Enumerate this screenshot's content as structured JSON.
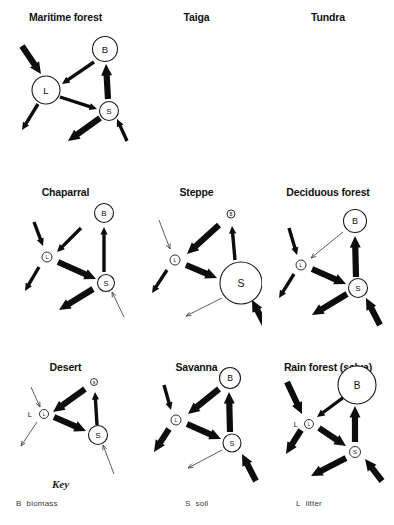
{
  "figure": {
    "width": 394,
    "height": 525,
    "background": "#ffffff",
    "ink_color": "#0d0d0d",
    "thin_arrow_color": "#4a4a4a"
  },
  "key": {
    "heading": "Key",
    "entries": [
      {
        "symbol": "B",
        "label": "biomass"
      },
      {
        "symbol": "S",
        "label": "soil"
      },
      {
        "symbol": "L",
        "label": "litter"
      }
    ]
  },
  "chart_data": {
    "type": "diagram",
    "compartment_legend": {
      "B": "biomass",
      "S": "soil",
      "L": "litter"
    },
    "flow_names": {
      "precip_to_litter": "precipitation input to litter",
      "biomass_to_litter": "litterfall (biomass to litter)",
      "litter_to_soil": "humus/decomposition (litter to soil)",
      "soil_to_biomass": "uptake (soil to biomass)",
      "litter_to_loss": "runoff loss from litter",
      "soil_to_loss": "leaching loss from soil",
      "weathering_to_soil": "weathering input to soil"
    },
    "panels": [
      {
        "id": "maritime-forest",
        "title": "Maritime forest",
        "nodes": [
          {
            "id": "B",
            "label": "B",
            "size": "medium",
            "cx": 105,
            "cy": 49,
            "r": 12.5,
            "font": 9.5
          },
          {
            "id": "L",
            "label": "L",
            "size": "medium",
            "cx": 46,
            "cy": 90,
            "r": 14,
            "font": 9.5
          },
          {
            "id": "S",
            "label": "S",
            "size": "small-medium",
            "cx": 109,
            "cy": 111,
            "r": 9.5,
            "font": 8
          }
        ],
        "flows": [
          {
            "name": "precip_to_litter",
            "weight": "thick",
            "x1": 22,
            "y1": 46,
            "x2": 41,
            "y2": 74
          },
          {
            "name": "biomass_to_litter",
            "weight": "medium",
            "x1": 94,
            "y1": 62,
            "x2": 62,
            "y2": 84
          },
          {
            "name": "soil_to_biomass",
            "weight": "thick",
            "x1": 108,
            "y1": 99,
            "x2": 106,
            "y2": 64
          },
          {
            "name": "litter_to_soil",
            "weight": "medium",
            "x1": 60,
            "y1": 97,
            "x2": 97,
            "y2": 109
          },
          {
            "name": "litter_to_loss",
            "weight": "medium",
            "x1": 38,
            "y1": 104,
            "x2": 22,
            "y2": 130
          },
          {
            "name": "soil_to_loss",
            "weight": "thick",
            "x1": 100,
            "y1": 118,
            "x2": 68,
            "y2": 141
          },
          {
            "name": "weathering_to_soil",
            "weight": "medium",
            "x1": 127,
            "y1": 141,
            "x2": 117,
            "y2": 119
          }
        ]
      },
      {
        "id": "taiga",
        "title": "Taiga",
        "nodes": [
          {
            "id": "B",
            "label": "B",
            "size": "medium",
            "cx": 95,
            "cy": 48,
            "r": 11.5,
            "font": 9
          },
          {
            "id": "L",
            "label": "L",
            "size": "medium",
            "cx": 42,
            "cy": 98,
            "r": 13,
            "font": 9.5
          },
          {
            "id": "S",
            "label": "S",
            "size": "tiny",
            "cx": 100,
            "cy": 122,
            "r": 4,
            "font": 4.5
          }
        ],
        "flows": [
          {
            "name": "precip_to_litter",
            "weight": "thin",
            "x1": 20,
            "y1": 52,
            "x2": 37,
            "y2": 80
          },
          {
            "name": "biomass_to_litter",
            "weight": "thick",
            "x1": 87,
            "y1": 59,
            "x2": 55,
            "y2": 88
          },
          {
            "name": "soil_to_biomass",
            "weight": "medium",
            "x1": 99,
            "y1": 113,
            "x2": 96,
            "y2": 62
          },
          {
            "name": "litter_to_soil",
            "weight": "thin",
            "x1": 57,
            "y1": 105,
            "x2": 92,
            "y2": 119
          },
          {
            "name": "litter_to_loss",
            "weight": "thick",
            "x1": 31,
            "y1": 110,
            "x2": 14,
            "y2": 136
          },
          {
            "name": "soil_to_loss",
            "weight": "thin",
            "x1": 89,
            "y1": 130,
            "x2": 56,
            "y2": 146
          },
          {
            "name": "weathering_to_soil",
            "weight": "thin",
            "x1": 117,
            "y1": 152,
            "x2": 105,
            "y2": 129
          }
        ]
      },
      {
        "id": "tundra",
        "title": "Tundra",
        "nodes": [
          {
            "id": "B",
            "label": "B",
            "size": "tiny",
            "cx": 95,
            "cy": 50,
            "r": 3.5,
            "font": 4,
            "outside_label": "B",
            "outside_dx": 5.5,
            "outside_dy": 0,
            "outside_font": 6.5
          },
          {
            "id": "L",
            "label": "L",
            "size": "tiny",
            "cx": 32,
            "cy": 102,
            "r": 4.5,
            "font": 4.5
          },
          {
            "id": "S",
            "label": "S",
            "size": "tiny",
            "cx": 92,
            "cy": 125,
            "r": 4.5,
            "font": 4.5
          }
        ],
        "flows": [
          {
            "name": "precip_to_litter",
            "weight": "thin",
            "x1": 17,
            "y1": 58,
            "x2": 29,
            "y2": 92
          },
          {
            "name": "biomass_to_litter",
            "weight": "thick",
            "x1": 81,
            "y1": 69,
            "x2": 42,
            "y2": 96
          },
          {
            "name": "soil_to_biomass",
            "weight": "thin",
            "x1": 92,
            "y1": 117,
            "x2": 93,
            "y2": 61
          },
          {
            "name": "litter_to_soil",
            "weight": "thin",
            "x1": 42,
            "y1": 107,
            "x2": 84,
            "y2": 121
          },
          {
            "name": "litter_to_loss",
            "weight": "thin",
            "x1": 26,
            "y1": 110,
            "x2": 9,
            "y2": 137
          },
          {
            "name": "weathering_to_soil",
            "weight": "thin",
            "x1": 109,
            "y1": 155,
            "x2": 97,
            "y2": 133
          }
        ]
      },
      {
        "id": "chaparral",
        "title": "Chaparral",
        "nodes": [
          {
            "id": "B",
            "label": "B",
            "size": "medium",
            "cx": 104,
            "cy": 213,
            "r": 9.5,
            "font": 8
          },
          {
            "id": "L",
            "label": "L",
            "size": "tiny",
            "cx": 47,
            "cy": 257,
            "r": 5,
            "font": 5
          },
          {
            "id": "S",
            "label": "S",
            "size": "small-medium",
            "cx": 106,
            "cy": 283,
            "r": 8.5,
            "font": 7.5
          }
        ],
        "flows": [
          {
            "name": "precip_to_litter",
            "weight": "medium",
            "x1": 34,
            "y1": 222,
            "x2": 43,
            "y2": 246
          },
          {
            "name": "biomass_to_litter",
            "weight": "medium",
            "x1": 81,
            "y1": 228,
            "x2": 57,
            "y2": 252
          },
          {
            "name": "soil_to_biomass",
            "weight": "medium",
            "x1": 104,
            "y1": 272,
            "x2": 104,
            "y2": 227
          },
          {
            "name": "litter_to_soil",
            "weight": "thick",
            "x1": 58,
            "y1": 262,
            "x2": 96,
            "y2": 279
          },
          {
            "name": "litter_to_loss",
            "weight": "medium",
            "x1": 39,
            "y1": 267,
            "x2": 25,
            "y2": 291
          },
          {
            "name": "soil_to_loss",
            "weight": "thick",
            "x1": 93,
            "y1": 289,
            "x2": 59,
            "y2": 310
          },
          {
            "name": "weathering_to_soil",
            "weight": "thin",
            "x1": 124,
            "y1": 317,
            "x2": 112,
            "y2": 292
          }
        ]
      },
      {
        "id": "steppe",
        "title": "Steppe",
        "nodes": [
          {
            "id": "B",
            "label": "B",
            "size": "tiny",
            "cx": 231,
            "cy": 214,
            "r": 4,
            "font": 4.5
          },
          {
            "id": "L",
            "label": "L",
            "size": "tiny",
            "cx": 175,
            "cy": 260,
            "r": 5,
            "font": 5
          },
          {
            "id": "S",
            "label": "S",
            "size": "large",
            "cx": 241,
            "cy": 283,
            "r": 21,
            "font": 10.5
          }
        ],
        "flows": [
          {
            "name": "precip_to_litter",
            "weight": "thin",
            "x1": 159,
            "y1": 220,
            "x2": 170,
            "y2": 249
          },
          {
            "name": "biomass_to_litter",
            "weight": "thick",
            "x1": 219,
            "y1": 225,
            "x2": 187,
            "y2": 254
          },
          {
            "name": "soil_to_biomass",
            "weight": "medium",
            "x1": 235,
            "y1": 260,
            "x2": 232,
            "y2": 226
          },
          {
            "name": "litter_to_soil",
            "weight": "thick",
            "x1": 186,
            "y1": 265,
            "x2": 217,
            "y2": 278
          },
          {
            "name": "litter_to_loss",
            "weight": "medium",
            "x1": 167,
            "y1": 270,
            "x2": 152,
            "y2": 293
          },
          {
            "name": "soil_to_loss",
            "weight": "thin",
            "x1": 222,
            "y1": 298,
            "x2": 186,
            "y2": 316
          },
          {
            "name": "weathering_to_soil",
            "weight": "thick",
            "x1": 266,
            "y1": 327,
            "x2": 252,
            "y2": 300
          }
        ]
      },
      {
        "id": "deciduous-forest",
        "title": "Deciduous forest",
        "nodes": [
          {
            "id": "B",
            "label": "B",
            "size": "medium",
            "cx": 356,
            "cy": 221,
            "r": 11.5,
            "font": 9
          },
          {
            "id": "L",
            "label": "L",
            "size": "tiny",
            "cx": 302,
            "cy": 265,
            "r": 5,
            "font": 5
          },
          {
            "id": "S",
            "label": "S",
            "size": "small-medium",
            "cx": 359,
            "cy": 288,
            "r": 9.5,
            "font": 8
          }
        ],
        "flows": [
          {
            "name": "precip_to_litter",
            "weight": "medium",
            "x1": 290,
            "y1": 228,
            "x2": 298,
            "y2": 255
          },
          {
            "name": "biomass_to_litter",
            "weight": "thin",
            "x1": 344,
            "y1": 232,
            "x2": 312,
            "y2": 258
          },
          {
            "name": "soil_to_biomass",
            "weight": "thick",
            "x1": 357,
            "y1": 277,
            "x2": 356,
            "y2": 236
          },
          {
            "name": "litter_to_soil",
            "weight": "thick",
            "x1": 313,
            "y1": 269,
            "x2": 347,
            "y2": 284
          },
          {
            "name": "litter_to_loss",
            "weight": "medium",
            "x1": 295,
            "y1": 274,
            "x2": 280,
            "y2": 298
          },
          {
            "name": "soil_to_loss",
            "weight": "thick",
            "x1": 348,
            "y1": 294,
            "x2": 313,
            "y2": 315
          },
          {
            "name": "weathering_to_soil",
            "weight": "thick",
            "x1": 381,
            "y1": 325,
            "x2": 367,
            "y2": 298
          }
        ]
      },
      {
        "id": "desert",
        "title": "Desert",
        "nodes": [
          {
            "id": "B",
            "label": "B",
            "size": "tiny",
            "cx": 94,
            "cy": 382,
            "r": 3.5,
            "font": 4
          },
          {
            "id": "L",
            "label": "L",
            "size": "tiny",
            "cx": 44,
            "cy": 414,
            "r": 4.5,
            "font": 4.5,
            "outside_label": "L",
            "outside_dx": -12,
            "outside_dy": 0,
            "outside_font": 7.5
          },
          {
            "id": "S",
            "label": "S",
            "size": "small-medium",
            "cx": 98,
            "cy": 435,
            "r": 9.5,
            "font": 8
          }
        ],
        "flows": [
          {
            "name": "precip_to_litter",
            "weight": "thin",
            "x1": 31,
            "y1": 387,
            "x2": 40,
            "y2": 407
          },
          {
            "name": "biomass_to_litter",
            "weight": "thick",
            "x1": 85,
            "y1": 389,
            "x2": 53,
            "y2": 412
          },
          {
            "name": "soil_to_biomass",
            "weight": "medium",
            "x1": 97,
            "y1": 425,
            "x2": 95,
            "y2": 392
          },
          {
            "name": "litter_to_soil",
            "weight": "thick",
            "x1": 54,
            "y1": 417,
            "x2": 86,
            "y2": 431
          },
          {
            "name": "litter_to_loss",
            "weight": "thin",
            "x1": 37,
            "y1": 422,
            "x2": 21,
            "y2": 446
          },
          {
            "name": "weathering_to_soil",
            "weight": "thin",
            "x1": 114,
            "y1": 474,
            "x2": 103,
            "y2": 445
          }
        ]
      },
      {
        "id": "savanna",
        "title": "Savanna",
        "nodes": [
          {
            "id": "B",
            "label": "B",
            "size": "medium",
            "cx": 230,
            "cy": 378,
            "r": 10.5,
            "font": 8.5
          },
          {
            "id": "L",
            "label": "L",
            "size": "tiny",
            "cx": 176,
            "cy": 420,
            "r": 5,
            "font": 5
          },
          {
            "id": "S",
            "label": "S",
            "size": "small-medium",
            "cx": 232,
            "cy": 443,
            "r": 9,
            "font": 7.5
          }
        ],
        "flows": [
          {
            "name": "precip_to_litter",
            "weight": "medium",
            "x1": 164,
            "y1": 385,
            "x2": 171,
            "y2": 410
          },
          {
            "name": "biomass_to_litter",
            "weight": "thick",
            "x1": 219,
            "y1": 389,
            "x2": 188,
            "y2": 414
          },
          {
            "name": "soil_to_biomass",
            "weight": "thick",
            "x1": 230,
            "y1": 432,
            "x2": 229,
            "y2": 392
          },
          {
            "name": "litter_to_soil",
            "weight": "thick",
            "x1": 187,
            "y1": 424,
            "x2": 221,
            "y2": 439
          },
          {
            "name": "litter_to_loss",
            "weight": "thick",
            "x1": 169,
            "y1": 429,
            "x2": 154,
            "y2": 452
          },
          {
            "name": "soil_to_loss",
            "weight": "thin",
            "x1": 222,
            "y1": 450,
            "x2": 188,
            "y2": 468
          },
          {
            "name": "weathering_to_soil",
            "weight": "thick",
            "x1": 256,
            "y1": 481,
            "x2": 242,
            "y2": 454
          }
        ]
      },
      {
        "id": "rain-forest",
        "title": "Rain forest (selva)",
        "nodes": [
          {
            "id": "B",
            "label": "B",
            "size": "large",
            "cx": 358,
            "cy": 385,
            "r": 19,
            "font": 10
          },
          {
            "id": "L",
            "label": "L",
            "size": "tiny",
            "cx": 310,
            "cy": 424,
            "r": 4.5,
            "font": 4.5,
            "outside_label": "L",
            "outside_dx": -11,
            "outside_dy": 0,
            "outside_font": 7.5
          },
          {
            "id": "S",
            "label": "S",
            "size": "tiny",
            "cx": 356,
            "cy": 452,
            "r": 5.5,
            "font": 5.5
          }
        ],
        "flows": [
          {
            "name": "precip_to_litter",
            "weight": "thick",
            "x1": 288,
            "y1": 382,
            "x2": 303,
            "y2": 414
          },
          {
            "name": "biomass_to_litter",
            "weight": "medium",
            "x1": 345,
            "y1": 397,
            "x2": 318,
            "y2": 417
          },
          {
            "name": "soil_to_biomass",
            "weight": "thick",
            "x1": 356,
            "y1": 442,
            "x2": 356,
            "y2": 406
          },
          {
            "name": "litter_to_soil",
            "weight": "thick",
            "x1": 320,
            "y1": 428,
            "x2": 347,
            "y2": 446
          },
          {
            "name": "litter_to_loss",
            "weight": "thick",
            "x1": 302,
            "y1": 430,
            "x2": 287,
            "y2": 454
          },
          {
            "name": "soil_to_loss",
            "weight": "thick",
            "x1": 347,
            "y1": 458,
            "x2": 312,
            "y2": 476
          },
          {
            "name": "weathering_to_soil",
            "weight": "thick",
            "x1": 383,
            "y1": 481,
            "x2": 366,
            "y2": 459
          }
        ]
      }
    ]
  }
}
